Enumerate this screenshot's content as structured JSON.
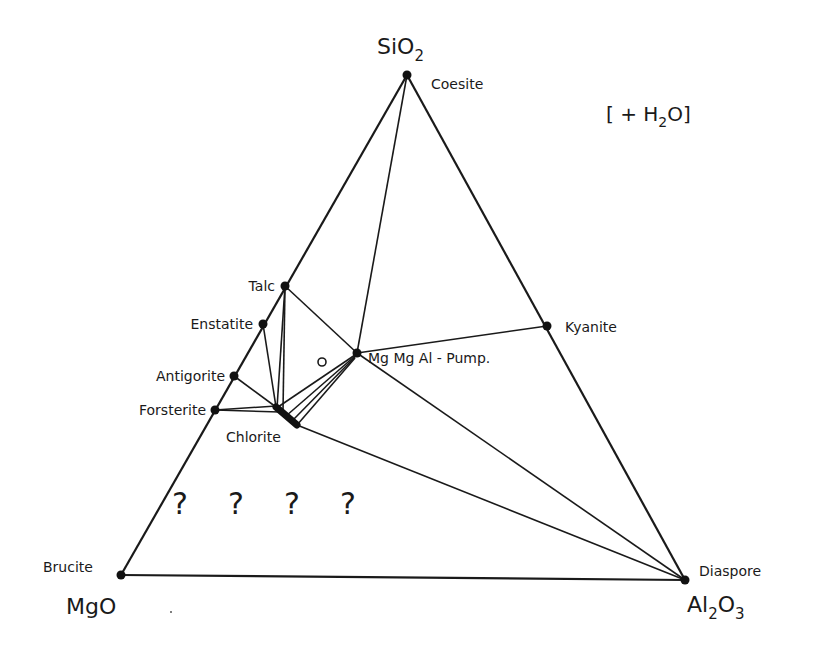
{
  "diagram": {
    "type": "ternary-phase-diagram",
    "annotation": "[ + H2O]",
    "components": [
      {
        "formula": "SiO",
        "subscript": "2",
        "position": "top",
        "mineral": "Coesite"
      },
      {
        "formula": "MgO",
        "subscript": "",
        "position": "bottom-left",
        "mineral": "Brucite"
      },
      {
        "formula": "Al",
        "subscript": "2",
        "formula2": "O",
        "subscript2": "3",
        "position": "bottom-right",
        "mineral": "Diaspore"
      }
    ],
    "labels": {
      "sio2_main": "SiO",
      "sio2_sub": "2",
      "mgo": "MgO",
      "al2o3_a": "Al",
      "al2o3_sub1": "2",
      "al2o3_b": "O",
      "al2o3_sub2": "3",
      "water_open": "[ + H",
      "water_sub": "2",
      "water_close": "O]"
    },
    "minerals": [
      {
        "name": "Coesite",
        "x": 407,
        "y": 75
      },
      {
        "name": "Talc",
        "x": 285,
        "y": 286
      },
      {
        "name": "Enstatite",
        "x": 263,
        "y": 324
      },
      {
        "name": "Antigorite",
        "x": 234,
        "y": 376
      },
      {
        "name": "Forsterite",
        "x": 215,
        "y": 410
      },
      {
        "name": "Chlorite",
        "x": 286,
        "y": 416
      },
      {
        "name": "Mg Mg Al - Pump.",
        "x": 357,
        "y": 353
      },
      {
        "name": "Kyanite",
        "x": 547,
        "y": 326
      },
      {
        "name": "Brucite",
        "x": 121,
        "y": 575
      },
      {
        "name": "Diaspore",
        "x": 685,
        "y": 580
      }
    ],
    "unknown_fields": [
      "?",
      "?",
      "?",
      "?"
    ],
    "open_circle_marker": "o"
  }
}
